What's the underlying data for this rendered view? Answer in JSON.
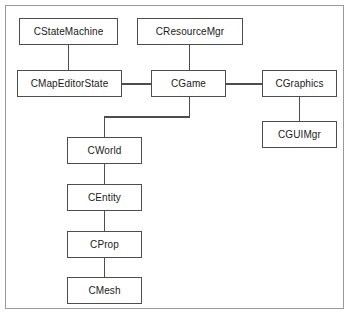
{
  "figure": {
    "frame": {
      "border_color": "#9a9a9a",
      "background_color": "#ffffff"
    },
    "style": {
      "box_border_color": "#4d4d4d",
      "box_fill_color": "#ffffff",
      "connector_color": "#4d4d4d",
      "text_color": "#1a1a1a"
    }
  },
  "nodes": [
    {
      "id": "cstatemachine",
      "label": "CStateMachine",
      "x": 19,
      "y": 18,
      "w": 99,
      "h": 27
    },
    {
      "id": "cresourcemgr",
      "label": "CResourceMgr",
      "x": 137,
      "y": 18,
      "w": 106,
      "h": 27
    },
    {
      "id": "cmapeditorstate",
      "label": "CMapEditorState",
      "x": 17,
      "y": 70,
      "w": 105,
      "h": 27
    },
    {
      "id": "cgame",
      "label": "CGame",
      "x": 151,
      "y": 70,
      "w": 75,
      "h": 27
    },
    {
      "id": "cgraphics",
      "label": "CGraphics",
      "x": 262,
      "y": 70,
      "w": 75,
      "h": 27
    },
    {
      "id": "cguimgr",
      "label": "CGUIMgr",
      "x": 262,
      "y": 121,
      "w": 75,
      "h": 27
    },
    {
      "id": "cworld",
      "label": "CWorld",
      "x": 67,
      "y": 137,
      "w": 75,
      "h": 27
    },
    {
      "id": "centity",
      "label": "CEntity",
      "x": 67,
      "y": 184,
      "w": 75,
      "h": 27
    },
    {
      "id": "cprop",
      "label": "CProp",
      "x": 67,
      "y": 231,
      "w": 75,
      "h": 27
    },
    {
      "id": "cmesh",
      "label": "CMesh",
      "x": 67,
      "y": 277,
      "w": 75,
      "h": 27
    }
  ],
  "edges": [
    {
      "id": "edge-cstatemachine-cmapeditorstate",
      "from": "cstatemachine",
      "to": "cmapeditorstate",
      "kind": "vertical"
    },
    {
      "id": "edge-cresourcemgr-cgame",
      "from": "cresourcemgr",
      "to": "cgame",
      "kind": "vertical"
    },
    {
      "id": "edge-cmapeditorstate-cgame",
      "from": "cmapeditorstate",
      "to": "cgame",
      "kind": "horizontal"
    },
    {
      "id": "edge-cgame-cgraphics",
      "from": "cgame",
      "to": "cgraphics",
      "kind": "horizontal"
    },
    {
      "id": "edge-cgraphics-cguimgr",
      "from": "cgraphics",
      "to": "cguimgr",
      "kind": "vertical"
    },
    {
      "id": "edge-cgame-cworld",
      "from": "cgame",
      "to": "cworld",
      "kind": "elbow"
    },
    {
      "id": "edge-cworld-centity",
      "from": "cworld",
      "to": "centity",
      "kind": "vertical"
    },
    {
      "id": "edge-centity-cprop",
      "from": "centity",
      "to": "cprop",
      "kind": "vertical"
    },
    {
      "id": "edge-cprop-cmesh",
      "from": "cprop",
      "to": "cmesh",
      "kind": "vertical"
    }
  ]
}
